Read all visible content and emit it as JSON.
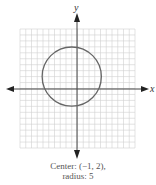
{
  "figure": {
    "x_axis_label": "x",
    "y_axis_label": "y",
    "caption_line1": "Center: (−1, 2),",
    "caption_line2": "radius: 5",
    "grid": {
      "xmin": -10,
      "xmax": 10,
      "ymin": -10,
      "ymax": 10,
      "step": 1
    },
    "circle": {
      "center_x": -1,
      "center_y": 2,
      "radius": 5
    },
    "colors": {
      "grid": "#d0d0d0",
      "axis": "#444444",
      "circle": "#666666",
      "caption": "#555555"
    }
  },
  "chart_data": {
    "type": "scatter",
    "title": "",
    "xlabel": "x",
    "ylabel": "y",
    "xlim": [
      -10,
      10
    ],
    "ylim": [
      -10,
      10
    ],
    "grid": true,
    "shapes": [
      {
        "kind": "circle",
        "center": [
          -1,
          2
        ],
        "radius": 5
      }
    ],
    "annotations": [
      "Center: (−1, 2),",
      "radius: 5"
    ]
  }
}
